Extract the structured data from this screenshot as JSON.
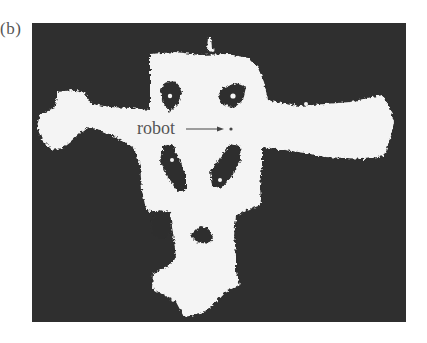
{
  "figure": {
    "panel_label": "(b)",
    "annotation": {
      "text": "robot",
      "arrow": "right-arrow",
      "target": "robot-position-dot"
    },
    "colors": {
      "background_occupied": "#2f2f2f",
      "free_space": "#f4f4f4",
      "label_text": "#555555"
    }
  }
}
